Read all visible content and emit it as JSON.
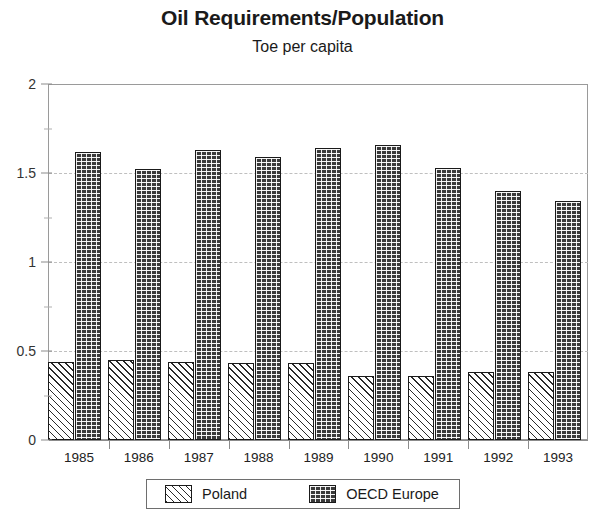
{
  "chart_data": {
    "type": "bar",
    "title": "Oil Requirements/Population",
    "subtitle": "Toe per capita",
    "xlabel": "",
    "ylabel": "",
    "ylim": [
      0,
      2
    ],
    "yticks": [
      "0",
      "0.5",
      "1",
      "1.5",
      "2"
    ],
    "ytick_values": [
      0,
      0.5,
      1,
      1.5,
      2
    ],
    "yminor_values": [
      0.25,
      0.75,
      1.25,
      1.75
    ],
    "grid": "horizontal-dashed-at-major-ticks",
    "legend_position": "bottom-center",
    "categories": [
      "1985",
      "1986",
      "1987",
      "1988",
      "1989",
      "1990",
      "1991",
      "1992",
      "1993"
    ],
    "series": [
      {
        "name": "Poland",
        "pattern": "diagonal-hatch",
        "values": [
          0.44,
          0.45,
          0.44,
          0.43,
          0.43,
          0.36,
          0.36,
          0.38,
          0.38
        ]
      },
      {
        "name": "OECD Europe",
        "pattern": "brick-fill",
        "values": [
          1.62,
          1.52,
          1.63,
          1.59,
          1.64,
          1.66,
          1.53,
          1.4,
          1.34
        ]
      }
    ]
  },
  "legend": {
    "items": [
      {
        "label": "Poland"
      },
      {
        "label": "OECD Europe"
      }
    ]
  },
  "colors": {
    "poland_fill": "#ffffff",
    "poland_hatch": "#2a2a2a",
    "oecd_fill": "#3a3a3a",
    "axis": "#8c8c8c",
    "gridline": "#bfbfbf",
    "text": "#1a1a1a",
    "background": "#ffffff"
  }
}
